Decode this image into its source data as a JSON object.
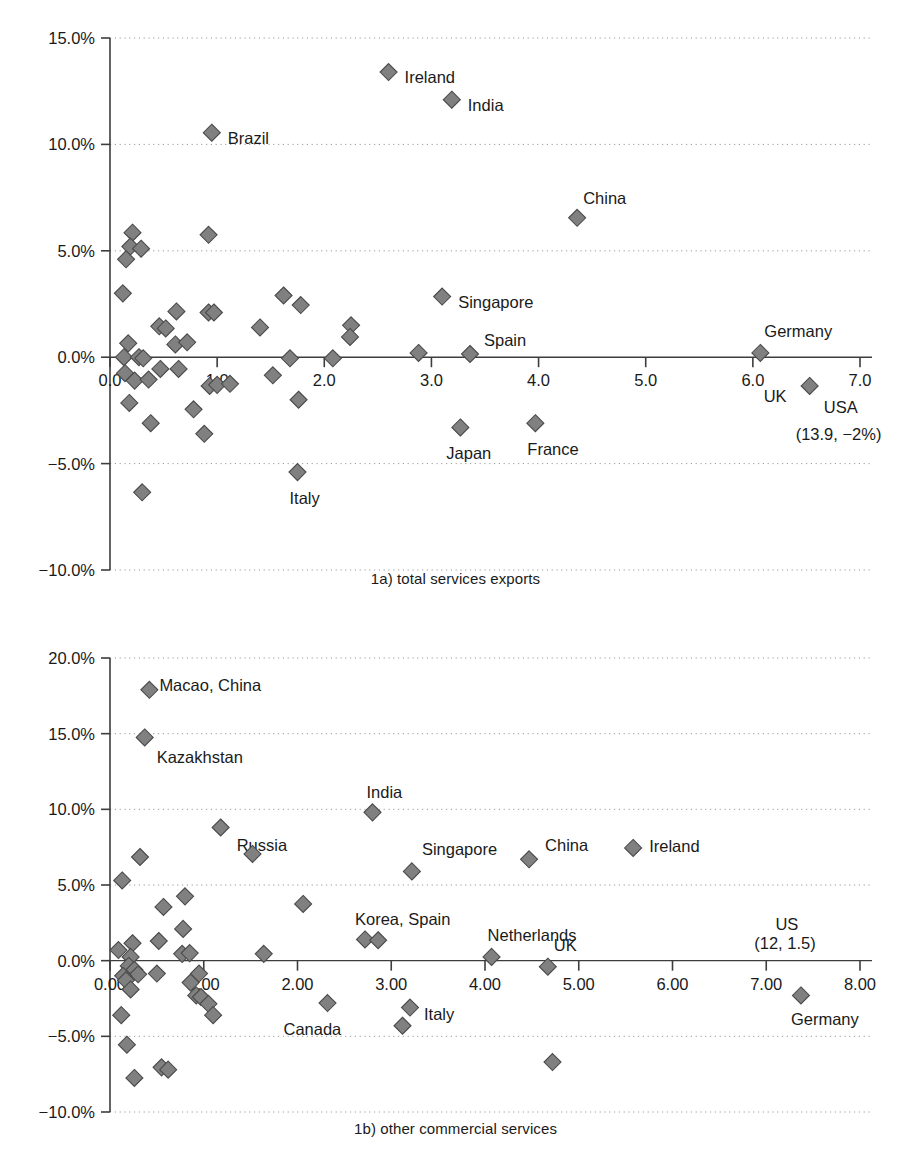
{
  "figure": {
    "marker_color": "#808080",
    "marker_outline": "#4a4a4a",
    "axis_color": "#3d3d3d",
    "grid_color": "#9a9a9a",
    "background": "#ffffff"
  },
  "chart_data": [
    {
      "type": "scatter",
      "id": "1a",
      "title": "1a) total services exports",
      "xlabel": "",
      "ylabel": "",
      "xlim": [
        0.0,
        7.0
      ],
      "ylim": [
        -10.0,
        15.0
      ],
      "grid": true,
      "legend": "none",
      "xticks": [
        "0.0",
        "1.0",
        "2.0",
        "3.0",
        "4.0",
        "5.0",
        "6.0",
        "7.0"
      ],
      "xtick_values": [
        0.0,
        1.0,
        2.0,
        3.0,
        4.0,
        5.0,
        6.0,
        7.0
      ],
      "yticks": [
        "15.0%",
        "10.0%",
        "5.0%",
        "0.0%",
        "-5.0%",
        "-10.0%"
      ],
      "ytick_values": [
        15.0,
        10.0,
        5.0,
        0.0,
        -5.0,
        -10.0
      ],
      "points": [
        {
          "x": 2.6,
          "y": 13.4,
          "label": "Ireland",
          "lx": 16,
          "ly": 5
        },
        {
          "x": 3.19,
          "y": 12.1,
          "label": "India",
          "lx": 16,
          "ly": 5
        },
        {
          "x": 0.95,
          "y": 10.55,
          "label": "Brazil",
          "lx": 16,
          "ly": 5
        },
        {
          "x": 4.36,
          "y": 6.55,
          "label": "China",
          "lx": 6,
          "ly": -20
        },
        {
          "x": 3.1,
          "y": 2.85,
          "label": "Singapore",
          "lx": 16,
          "ly": 5
        },
        {
          "x": 3.36,
          "y": 0.15,
          "label": "Spain",
          "lx": 14,
          "ly": -14
        },
        {
          "x": 6.07,
          "y": 0.2,
          "label": "Germany",
          "lx": 4,
          "ly": -22
        },
        {
          "x": 6.53,
          "y": -1.35,
          "label": "UK",
          "lx": -46,
          "ly": 10
        },
        {
          "x": 3.27,
          "y": -3.3,
          "label": "Japan",
          "lx": -14,
          "ly": 26
        },
        {
          "x": 3.97,
          "y": -3.1,
          "label": "France",
          "lx": -8,
          "ly": 26
        },
        {
          "x": 1.75,
          "y": -5.4,
          "label": "Italy",
          "lx": -8,
          "ly": 26
        },
        {
          "x": 0.21,
          "y": 5.85,
          "label": "",
          "lx": 0,
          "ly": 0
        },
        {
          "x": 0.19,
          "y": 5.2,
          "label": "",
          "lx": 0,
          "ly": 0
        },
        {
          "x": 0.29,
          "y": 5.1,
          "label": "",
          "lx": 0,
          "ly": 0
        },
        {
          "x": 0.15,
          "y": 4.6,
          "label": "",
          "lx": 0,
          "ly": 0
        },
        {
          "x": 0.92,
          "y": 5.75,
          "label": "",
          "lx": 0,
          "ly": 0
        },
        {
          "x": 0.12,
          "y": 3.0,
          "label": "",
          "lx": 0,
          "ly": 0
        },
        {
          "x": 1.62,
          "y": 2.9,
          "label": "",
          "lx": 0,
          "ly": 0
        },
        {
          "x": 1.78,
          "y": 2.45,
          "label": "",
          "lx": 0,
          "ly": 0
        },
        {
          "x": 0.62,
          "y": 2.15,
          "label": "",
          "lx": 0,
          "ly": 0
        },
        {
          "x": 0.92,
          "y": 2.1,
          "label": "",
          "lx": 0,
          "ly": 0
        },
        {
          "x": 0.97,
          "y": 2.1,
          "label": "",
          "lx": 0,
          "ly": 0
        },
        {
          "x": 0.46,
          "y": 1.45,
          "label": "",
          "lx": 0,
          "ly": 0
        },
        {
          "x": 0.52,
          "y": 1.35,
          "label": "",
          "lx": 0,
          "ly": 0
        },
        {
          "x": 1.4,
          "y": 1.4,
          "label": "",
          "lx": 0,
          "ly": 0
        },
        {
          "x": 2.25,
          "y": 1.5,
          "label": "",
          "lx": 0,
          "ly": 0
        },
        {
          "x": 2.24,
          "y": 0.95,
          "label": "",
          "lx": 0,
          "ly": 0
        },
        {
          "x": 0.17,
          "y": 0.65,
          "label": "",
          "lx": 0,
          "ly": 0
        },
        {
          "x": 0.61,
          "y": 0.6,
          "label": "",
          "lx": 0,
          "ly": 0
        },
        {
          "x": 0.72,
          "y": 0.7,
          "label": "",
          "lx": 0,
          "ly": 0
        },
        {
          "x": 0.13,
          "y": 0.0,
          "label": "",
          "lx": 0,
          "ly": 0
        },
        {
          "x": 0.27,
          "y": 0.0,
          "label": "",
          "lx": 0,
          "ly": 0
        },
        {
          "x": 0.31,
          "y": -0.05,
          "label": "",
          "lx": 0,
          "ly": 0
        },
        {
          "x": 1.68,
          "y": -0.05,
          "label": "",
          "lx": 0,
          "ly": 0
        },
        {
          "x": 2.08,
          "y": -0.05,
          "label": "",
          "lx": 0,
          "ly": 0
        },
        {
          "x": 2.88,
          "y": 0.2,
          "label": "",
          "lx": 0,
          "ly": 0
        },
        {
          "x": 0.47,
          "y": -0.55,
          "label": "",
          "lx": 0,
          "ly": 0
        },
        {
          "x": 0.64,
          "y": -0.55,
          "label": "",
          "lx": 0,
          "ly": 0
        },
        {
          "x": 0.14,
          "y": -0.75,
          "label": "",
          "lx": 0,
          "ly": 0
        },
        {
          "x": 0.23,
          "y": -1.1,
          "label": "",
          "lx": 0,
          "ly": 0
        },
        {
          "x": 0.36,
          "y": -1.05,
          "label": "",
          "lx": 0,
          "ly": 0
        },
        {
          "x": 0.93,
          "y": -1.35,
          "label": "",
          "lx": 0,
          "ly": 0
        },
        {
          "x": 1.0,
          "y": -1.3,
          "label": "",
          "lx": 0,
          "ly": 0
        },
        {
          "x": 1.12,
          "y": -1.25,
          "label": "",
          "lx": 0,
          "ly": 0
        },
        {
          "x": 1.52,
          "y": -0.85,
          "label": "",
          "lx": 0,
          "ly": 0
        },
        {
          "x": 0.18,
          "y": -2.15,
          "label": "",
          "lx": 0,
          "ly": 0
        },
        {
          "x": 1.76,
          "y": -2.0,
          "label": "",
          "lx": 0,
          "ly": 0
        },
        {
          "x": 0.38,
          "y": -3.1,
          "label": "",
          "lx": 0,
          "ly": 0
        },
        {
          "x": 0.78,
          "y": -2.45,
          "label": "",
          "lx": 0,
          "ly": 0
        },
        {
          "x": 0.88,
          "y": -3.6,
          "label": "",
          "lx": 0,
          "ly": 0
        },
        {
          "x": 0.3,
          "y": -6.35,
          "label": "",
          "lx": 0,
          "ly": 0
        }
      ],
      "annotations": [
        {
          "text": "USA",
          "x": 6.82,
          "y": -2.35,
          "align": "middle"
        },
        {
          "text": "(13.9, −2%)",
          "x": 6.8,
          "y": -3.6,
          "align": "middle"
        }
      ]
    },
    {
      "type": "scatter",
      "id": "1b",
      "title": "1b) other commercial services",
      "xlabel": "",
      "ylabel": "",
      "xlim": [
        0.0,
        8.0
      ],
      "ylim": [
        -10.0,
        20.0
      ],
      "grid": true,
      "legend": "none",
      "xticks": [
        "0.00",
        "1.00",
        "2.00",
        "3.00",
        "4.00",
        "5.00",
        "6.00",
        "7.00",
        "8.00"
      ],
      "xtick_values": [
        0.0,
        1.0,
        2.0,
        3.0,
        4.0,
        5.0,
        6.0,
        7.0,
        8.0
      ],
      "yticks": [
        "20.0%",
        "15.0%",
        "10.0%",
        "5.0%",
        "0.0%",
        "-5.0%",
        "-10.0%"
      ],
      "ytick_values": [
        20.0,
        15.0,
        10.0,
        5.0,
        0.0,
        -5.0,
        -10.0
      ],
      "points": [
        {
          "x": 0.42,
          "y": 17.9,
          "label": "Macao, China",
          "lx": 10,
          "ly": -5
        },
        {
          "x": 0.37,
          "y": 14.75,
          "label": "Kazakhstan",
          "lx": 12,
          "ly": 20
        },
        {
          "x": 2.8,
          "y": 9.8,
          "label": "India",
          "lx": -6,
          "ly": -20
        },
        {
          "x": 1.18,
          "y": 8.8,
          "label": "Russia",
          "lx": 16,
          "ly": 18
        },
        {
          "x": 5.58,
          "y": 7.45,
          "label": "Ireland",
          "lx": 16,
          "ly": -2
        },
        {
          "x": 4.47,
          "y": 6.7,
          "label": "China",
          "lx": 16,
          "ly": -14
        },
        {
          "x": 3.22,
          "y": 5.9,
          "label": "Singapore",
          "lx": 10,
          "ly": -22
        },
        {
          "x": 2.72,
          "y": 1.4,
          "label": "Korea, Spain",
          "lx": -10,
          "ly": -20
        },
        {
          "x": 2.86,
          "y": 1.35,
          "label": "",
          "lx": 0,
          "ly": 0
        },
        {
          "x": 4.07,
          "y": 0.25,
          "label": "Netherlands",
          "lx": -4,
          "ly": -22
        },
        {
          "x": 4.67,
          "y": -0.4,
          "label": "UK",
          "lx": 6,
          "ly": -22
        },
        {
          "x": 7.37,
          "y": -2.3,
          "label": "Germany",
          "lx": -10,
          "ly": 24
        },
        {
          "x": 3.2,
          "y": -3.1,
          "label": "Italy",
          "lx": 14,
          "ly": 6
        },
        {
          "x": 2.32,
          "y": -2.8,
          "label": "Canada",
          "lx": -44,
          "ly": 26
        },
        {
          "x": 1.52,
          "y": 7.05,
          "label": "",
          "lx": 0,
          "ly": 0
        },
        {
          "x": 0.32,
          "y": 6.85,
          "label": "",
          "lx": 0,
          "ly": 0
        },
        {
          "x": 0.13,
          "y": 5.3,
          "label": "",
          "lx": 0,
          "ly": 0
        },
        {
          "x": 0.8,
          "y": 4.25,
          "label": "",
          "lx": 0,
          "ly": 0
        },
        {
          "x": 2.06,
          "y": 3.75,
          "label": "",
          "lx": 0,
          "ly": 0
        },
        {
          "x": 0.57,
          "y": 3.55,
          "label": "",
          "lx": 0,
          "ly": 0
        },
        {
          "x": 0.78,
          "y": 2.1,
          "label": "",
          "lx": 0,
          "ly": 0
        },
        {
          "x": 0.52,
          "y": 1.3,
          "label": "",
          "lx": 0,
          "ly": 0
        },
        {
          "x": 0.24,
          "y": 1.15,
          "label": "",
          "lx": 0,
          "ly": 0
        },
        {
          "x": 0.09,
          "y": 0.7,
          "label": "",
          "lx": 0,
          "ly": 0
        },
        {
          "x": 0.22,
          "y": 0.25,
          "label": "",
          "lx": 0,
          "ly": 0
        },
        {
          "x": 0.77,
          "y": 0.45,
          "label": "",
          "lx": 0,
          "ly": 0
        },
        {
          "x": 0.85,
          "y": 0.5,
          "label": "",
          "lx": 0,
          "ly": 0
        },
        {
          "x": 1.64,
          "y": 0.45,
          "label": "",
          "lx": 0,
          "ly": 0
        },
        {
          "x": 0.2,
          "y": -0.35,
          "label": "",
          "lx": 0,
          "ly": 0
        },
        {
          "x": 0.26,
          "y": -0.6,
          "label": "",
          "lx": 0,
          "ly": 0
        },
        {
          "x": 0.3,
          "y": -0.9,
          "label": "",
          "lx": 0,
          "ly": 0
        },
        {
          "x": 0.14,
          "y": -1.0,
          "label": "",
          "lx": 0,
          "ly": 0
        },
        {
          "x": 0.17,
          "y": -1.3,
          "label": "",
          "lx": 0,
          "ly": 0
        },
        {
          "x": 0.5,
          "y": -0.85,
          "label": "",
          "lx": 0,
          "ly": 0
        },
        {
          "x": 0.95,
          "y": -0.85,
          "label": "",
          "lx": 0,
          "ly": 0
        },
        {
          "x": 0.22,
          "y": -1.9,
          "label": "",
          "lx": 0,
          "ly": 0
        },
        {
          "x": 0.86,
          "y": -1.45,
          "label": "",
          "lx": 0,
          "ly": 0
        },
        {
          "x": 0.92,
          "y": -2.3,
          "label": "",
          "lx": 0,
          "ly": 0
        },
        {
          "x": 0.97,
          "y": -2.4,
          "label": "",
          "lx": 0,
          "ly": 0
        },
        {
          "x": 1.05,
          "y": -2.85,
          "label": "",
          "lx": 0,
          "ly": 0
        },
        {
          "x": 0.12,
          "y": -3.6,
          "label": "",
          "lx": 0,
          "ly": 0
        },
        {
          "x": 1.1,
          "y": -3.6,
          "label": "",
          "lx": 0,
          "ly": 0
        },
        {
          "x": 3.12,
          "y": -4.3,
          "label": "",
          "lx": 0,
          "ly": 0
        },
        {
          "x": 0.18,
          "y": -5.55,
          "label": "",
          "lx": 0,
          "ly": 0
        },
        {
          "x": 0.55,
          "y": -7.05,
          "label": "",
          "lx": 0,
          "ly": 0
        },
        {
          "x": 0.62,
          "y": -7.2,
          "label": "",
          "lx": 0,
          "ly": 0
        },
        {
          "x": 0.26,
          "y": -7.75,
          "label": "",
          "lx": 0,
          "ly": 0
        },
        {
          "x": 4.72,
          "y": -6.7,
          "label": "",
          "lx": 0,
          "ly": 0
        }
      ],
      "annotations": [
        {
          "text": "US",
          "x": 7.22,
          "y": 2.45,
          "align": "middle"
        },
        {
          "text": "(12, 1.5)",
          "x": 7.2,
          "y": 1.2,
          "align": "middle"
        }
      ]
    }
  ]
}
